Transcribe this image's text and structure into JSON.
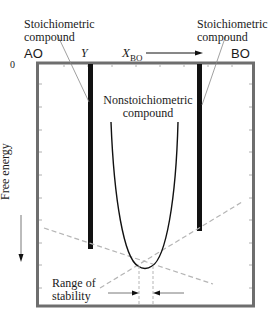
{
  "diagram": {
    "labels": {
      "stoich_left_line1": "Stoichiometric",
      "stoich_left_line2": "compound",
      "stoich_right_line1": "Stoichiometric",
      "stoich_right_line2": "compound",
      "nonstoich_line1": "Nonstoichiometric",
      "nonstoich_line2": "compound",
      "range_line1": "Range of",
      "range_line2": "stability",
      "left_end": "AO",
      "right_end": "BO",
      "gamma": "Y",
      "x_axis": "X",
      "x_axis_sub": "BO",
      "origin": "0",
      "y_axis": "Free energy"
    },
    "colors": {
      "frame": "#6e6e6e",
      "bars": "#111111",
      "curve": "#111111",
      "dashed": "#b5b5b5",
      "leader": "#888888"
    }
  }
}
